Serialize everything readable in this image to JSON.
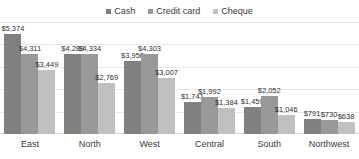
{
  "chart_data": {
    "type": "bar",
    "title": "",
    "subtitle": "",
    "xlabel": "",
    "ylabel": "",
    "ylim": [
      0,
      5600
    ],
    "grid": true,
    "legend_position": "top-center",
    "categories": [
      "East",
      "North",
      "West",
      "Central",
      "South",
      "Northwest"
    ],
    "series": [
      {
        "name": "Cash",
        "color": "#808080",
        "values": [
          5374,
          4289,
          3950,
          1741,
          1459,
          791
        ],
        "labels": [
          "$5,374",
          "$4,289",
          "$3,950",
          "$1,741",
          "$1,459",
          "$791"
        ]
      },
      {
        "name": "Credit card",
        "color": "#999999",
        "values": [
          4311,
          4334,
          4303,
          1992,
          2052,
          730
        ],
        "labels": [
          "$4,311",
          "$4,334",
          "$4,303",
          "$1,992",
          "$2,052",
          "$730"
        ]
      },
      {
        "name": "Cheque",
        "color": "#c0c0c0",
        "values": [
          3449,
          2769,
          3007,
          1384,
          1046,
          638
        ],
        "labels": [
          "$3,449",
          "$2,769",
          "$3,007",
          "$1,384",
          "$1,046",
          "$638"
        ]
      }
    ]
  },
  "legend": {
    "items": [
      {
        "label": "Cash",
        "color": "#808080"
      },
      {
        "label": "Credit card",
        "color": "#999999"
      },
      {
        "label": "Cheque",
        "color": "#c0c0c0"
      }
    ]
  }
}
